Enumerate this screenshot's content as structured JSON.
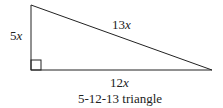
{
  "diagram": {
    "title": "5-12-13 triangle",
    "sides": {
      "vertical": {
        "coef": "5",
        "var": "x"
      },
      "hypotenuse": {
        "coef": "13",
        "var": "x"
      },
      "horizontal": {
        "coef": "12",
        "var": "x"
      }
    },
    "right_angle_marker": true,
    "colors": {
      "stroke": "#222222",
      "background": "#ffffff"
    }
  }
}
